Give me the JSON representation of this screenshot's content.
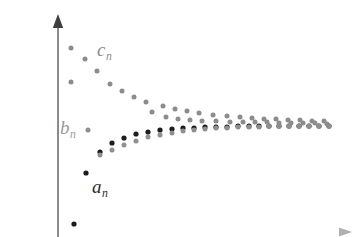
{
  "figure": {
    "title": "",
    "background": "#ffffff",
    "width": 359,
    "height": 237
  },
  "axes": {
    "y_axis": {
      "name": "vertical-axis",
      "x": 58,
      "y_top": 14,
      "y_bottom": 237,
      "color": "#6e6e6e",
      "arrow": "up"
    },
    "x_axis": {
      "name": "horizontal-axis",
      "y": 232,
      "x_left": 58,
      "x_right": 352,
      "color": "#9a9a9a",
      "arrow": "right"
    },
    "show_ticks": false,
    "show_gridlines": false
  },
  "labels": {
    "a": {
      "base": "a",
      "sub": "n",
      "color": "#2a2a2a",
      "x": 92,
      "y": 177
    },
    "b": {
      "base": "b",
      "sub": "n",
      "color": "#9a9a9a",
      "x": 60,
      "y": 118
    },
    "c": {
      "base": "c",
      "sub": "n",
      "color": "#8a8a8a",
      "x": 97,
      "y": 40
    }
  },
  "chart_data": {
    "type": "scatter",
    "title": "",
    "xlabel": "",
    "ylabel": "",
    "xlim": [
      0,
      359
    ],
    "ylim": [
      237,
      0
    ],
    "grid": false,
    "legend": "inline-annotations",
    "series": [
      {
        "name": "a_n",
        "label": "a_n",
        "color": "#1c1c1c",
        "radius": 2.6,
        "points": [
          [
            74,
            224
          ],
          [
            86,
            173
          ],
          [
            100,
            152
          ],
          [
            112,
            143
          ],
          [
            124,
            138
          ],
          [
            136,
            134
          ],
          [
            148,
            132
          ],
          [
            160,
            130
          ],
          [
            172,
            129
          ],
          [
            183,
            128
          ],
          [
            194,
            128
          ],
          [
            205,
            127
          ],
          [
            216,
            127
          ],
          [
            227,
            127
          ],
          [
            238,
            126
          ],
          [
            249,
            126
          ],
          [
            259,
            126
          ],
          [
            269,
            126
          ],
          [
            279,
            126
          ],
          [
            289,
            126
          ],
          [
            299,
            126
          ],
          [
            309,
            126
          ],
          [
            319,
            126
          ],
          [
            329,
            126
          ]
        ]
      },
      {
        "name": "b_n",
        "label": "b_n",
        "color": "#8f8f8f",
        "radius": 2.5,
        "points": [
          [
            88,
            130
          ],
          [
            100,
            155
          ],
          [
            112,
            150
          ],
          [
            124,
            145
          ],
          [
            136,
            141
          ],
          [
            148,
            137
          ],
          [
            160,
            135
          ],
          [
            172,
            133
          ],
          [
            183,
            131
          ],
          [
            194,
            130
          ],
          [
            205,
            129
          ],
          [
            216,
            128
          ],
          [
            227,
            128
          ],
          [
            238,
            127
          ],
          [
            249,
            127
          ],
          [
            259,
            127
          ],
          [
            269,
            126
          ],
          [
            279,
            126
          ],
          [
            289,
            126
          ],
          [
            299,
            126
          ],
          [
            309,
            126
          ],
          [
            319,
            126
          ],
          [
            329,
            126
          ]
        ]
      },
      {
        "name": "c_n",
        "label": "c_n",
        "color": "#8c8c8c",
        "radius": 2.5,
        "points": [
          [
            71,
            48
          ],
          [
            85,
            59
          ],
          [
            71,
            82
          ],
          [
            97,
            71
          ],
          [
            110,
            84
          ],
          [
            122,
            91
          ],
          [
            134,
            97
          ],
          [
            146,
            102
          ],
          [
            152,
            112
          ],
          [
            163,
            106
          ],
          [
            166,
            117
          ],
          [
            175,
            109
          ],
          [
            178,
            119
          ],
          [
            187,
            111
          ],
          [
            190,
            120
          ],
          [
            199,
            113
          ],
          [
            202,
            121
          ],
          [
            213,
            115
          ],
          [
            216,
            121
          ],
          [
            227,
            116
          ],
          [
            230,
            122
          ],
          [
            240,
            117
          ],
          [
            243,
            122
          ],
          [
            252,
            118
          ],
          [
            255,
            122
          ],
          [
            264,
            119
          ],
          [
            267,
            122
          ],
          [
            276,
            119
          ],
          [
            279,
            123
          ],
          [
            288,
            120
          ],
          [
            291,
            123
          ],
          [
            300,
            120
          ],
          [
            303,
            123
          ],
          [
            312,
            121
          ],
          [
            315,
            123
          ],
          [
            324,
            121
          ],
          [
            327,
            124
          ]
        ]
      }
    ]
  }
}
